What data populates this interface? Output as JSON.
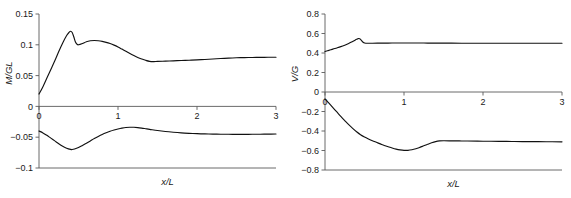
{
  "figure": {
    "background": "#ffffff",
    "curve_color": "#111111",
    "axis_color": "#5a5a5a",
    "text_color": "#1a1a1a"
  },
  "chart_data": [
    {
      "type": "line",
      "id": "left-panel",
      "title": "",
      "xlabel": "x/L",
      "ylabel": "M/GL",
      "xlim": [
        0,
        3
      ],
      "ylim": [
        -0.1,
        0.15
      ],
      "xticks": [
        0,
        1,
        2,
        3
      ],
      "xticklabels": [
        "0",
        "1",
        "2",
        "3"
      ],
      "yticks": [
        -0.1,
        -0.05,
        0,
        0.05,
        0.1,
        0.15
      ],
      "yticklabels": [
        "−0.1",
        "−0.05",
        "0",
        "0.05",
        "0.1",
        "0.15"
      ],
      "grid": false,
      "legend": "none",
      "series": [
        {
          "name": "upper",
          "x": [
            0.0,
            0.05,
            0.1,
            0.15,
            0.2,
            0.25,
            0.3,
            0.35,
            0.38,
            0.4,
            0.42,
            0.44,
            0.46,
            0.48,
            0.5,
            0.55,
            0.6,
            0.65,
            0.7,
            0.75,
            0.8,
            0.85,
            0.9,
            0.95,
            1.0,
            1.05,
            1.1,
            1.15,
            1.2,
            1.25,
            1.3,
            1.35,
            1.4,
            1.45,
            1.5,
            1.6,
            1.7,
            1.8,
            1.9,
            2.0,
            2.1,
            2.2,
            2.3,
            2.4,
            2.5,
            2.6,
            2.7,
            2.8,
            2.9,
            3.0
          ],
          "y": [
            0.02,
            0.032,
            0.046,
            0.06,
            0.074,
            0.089,
            0.103,
            0.115,
            0.12,
            0.122,
            0.12,
            0.113,
            0.105,
            0.101,
            0.1,
            0.102,
            0.105,
            0.1065,
            0.107,
            0.1065,
            0.1055,
            0.104,
            0.102,
            0.0995,
            0.0965,
            0.093,
            0.0895,
            0.086,
            0.0825,
            0.0795,
            0.077,
            0.0748,
            0.0732,
            0.0728,
            0.073,
            0.0735,
            0.074,
            0.0745,
            0.075,
            0.0755,
            0.0762,
            0.077,
            0.0777,
            0.0784,
            0.0789,
            0.0792,
            0.0794,
            0.0796,
            0.0797,
            0.0798
          ]
        },
        {
          "name": "lower",
          "x": [
            0.0,
            0.05,
            0.1,
            0.15,
            0.2,
            0.25,
            0.3,
            0.35,
            0.4,
            0.42,
            0.45,
            0.5,
            0.55,
            0.6,
            0.65,
            0.7,
            0.75,
            0.8,
            0.85,
            0.9,
            0.95,
            1.0,
            1.05,
            1.1,
            1.15,
            1.2,
            1.25,
            1.3,
            1.35,
            1.4,
            1.5,
            1.6,
            1.7,
            1.8,
            1.9,
            2.0,
            2.1,
            2.2,
            2.3,
            2.4,
            2.5,
            2.6,
            2.7,
            2.8,
            2.9,
            3.0
          ],
          "y": [
            -0.04,
            -0.043,
            -0.047,
            -0.0515,
            -0.056,
            -0.0605,
            -0.0645,
            -0.0678,
            -0.0698,
            -0.07,
            -0.0692,
            -0.0668,
            -0.0635,
            -0.0598,
            -0.056,
            -0.0522,
            -0.0487,
            -0.0455,
            -0.0427,
            -0.0403,
            -0.0383,
            -0.0366,
            -0.0352,
            -0.0342,
            -0.0338,
            -0.0339,
            -0.0344,
            -0.0352,
            -0.0362,
            -0.0372,
            -0.0392,
            -0.0408,
            -0.042,
            -0.043,
            -0.0437,
            -0.0443,
            -0.0447,
            -0.045,
            -0.0452,
            -0.0453,
            -0.0454,
            -0.0454,
            -0.0453,
            -0.0452,
            -0.045,
            -0.0448
          ]
        }
      ]
    },
    {
      "type": "line",
      "id": "right-panel",
      "title": "",
      "xlabel": "x/L",
      "ylabel": "V/G",
      "xlim": [
        0,
        3
      ],
      "ylim": [
        -0.8,
        0.8
      ],
      "xticks": [
        0,
        1,
        2,
        3
      ],
      "xticklabels": [
        "0",
        "1",
        "2",
        "3"
      ],
      "yticks": [
        -0.8,
        -0.6,
        -0.4,
        -0.2,
        0,
        0.2,
        0.4,
        0.6,
        0.8
      ],
      "yticklabels": [
        "−0.8",
        "−0.6",
        "−0.4",
        "−0.2",
        "0",
        "0.2",
        "0.4",
        "0.6",
        "0.8"
      ],
      "grid": false,
      "legend": "none",
      "series": [
        {
          "name": "upper",
          "x": [
            0.0,
            0.05,
            0.1,
            0.15,
            0.2,
            0.25,
            0.3,
            0.35,
            0.4,
            0.42,
            0.44,
            0.46,
            0.48,
            0.5,
            0.55,
            0.6,
            0.7,
            0.8,
            0.9,
            1.0,
            1.1,
            1.2,
            1.3,
            1.4,
            1.5,
            1.6,
            1.8,
            2.0,
            2.2,
            2.4,
            2.6,
            2.8,
            3.0
          ],
          "y": [
            0.415,
            0.427,
            0.44,
            0.452,
            0.465,
            0.48,
            0.497,
            0.518,
            0.54,
            0.548,
            0.545,
            0.53,
            0.512,
            0.503,
            0.5,
            0.5,
            0.501,
            0.502,
            0.503,
            0.503,
            0.503,
            0.503,
            0.502,
            0.502,
            0.501,
            0.501,
            0.5,
            0.5,
            0.5,
            0.5,
            0.5,
            0.5,
            0.5
          ]
        },
        {
          "name": "lower",
          "x": [
            0.0,
            0.05,
            0.1,
            0.15,
            0.2,
            0.25,
            0.3,
            0.35,
            0.4,
            0.45,
            0.5,
            0.55,
            0.6,
            0.65,
            0.7,
            0.75,
            0.8,
            0.85,
            0.9,
            0.95,
            1.0,
            1.05,
            1.1,
            1.15,
            1.2,
            1.25,
            1.3,
            1.35,
            1.4,
            1.45,
            1.5,
            1.6,
            1.7,
            1.8,
            2.0,
            2.2,
            2.4,
            2.6,
            2.8,
            3.0
          ],
          "y": [
            -0.07,
            -0.115,
            -0.16,
            -0.205,
            -0.25,
            -0.293,
            -0.335,
            -0.373,
            -0.408,
            -0.438,
            -0.462,
            -0.482,
            -0.5,
            -0.516,
            -0.532,
            -0.548,
            -0.562,
            -0.575,
            -0.586,
            -0.594,
            -0.599,
            -0.598,
            -0.592,
            -0.582,
            -0.568,
            -0.552,
            -0.536,
            -0.521,
            -0.509,
            -0.502,
            -0.5,
            -0.501,
            -0.502,
            -0.503,
            -0.505,
            -0.506,
            -0.508,
            -0.509,
            -0.51,
            -0.511
          ]
        }
      ]
    }
  ]
}
